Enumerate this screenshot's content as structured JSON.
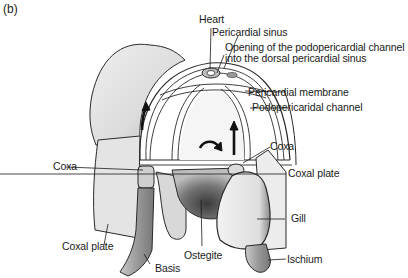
{
  "figure": {
    "panel_label": "(b)",
    "colors": {
      "line": "#2a2a2a",
      "shell_light": "#e6e6e6",
      "shell_mid": "#cfcfcf",
      "shadow": "#9a9a9a",
      "dark": "#555555",
      "background": "#ffffff"
    },
    "labels": {
      "heart": "Heart",
      "pericardial_sinus": "Pericardial sinus",
      "opening_line1": "Opening of the podopericardial channel",
      "opening_line2": "into the dorsal pericardial sinus",
      "pericardial_membrane": "Pericardial membrane",
      "podopericardial_channel": "Podopericaridal channel",
      "coxa_left": "Coxa",
      "coxa_right": "Coxa",
      "coxal_plate_right": "Coxal plate",
      "gill": "Gill",
      "coxal_plate_left": "Coxal plate",
      "ostegite": "Ostegite",
      "basis": "Basis",
      "ischium": "Ischium"
    }
  }
}
